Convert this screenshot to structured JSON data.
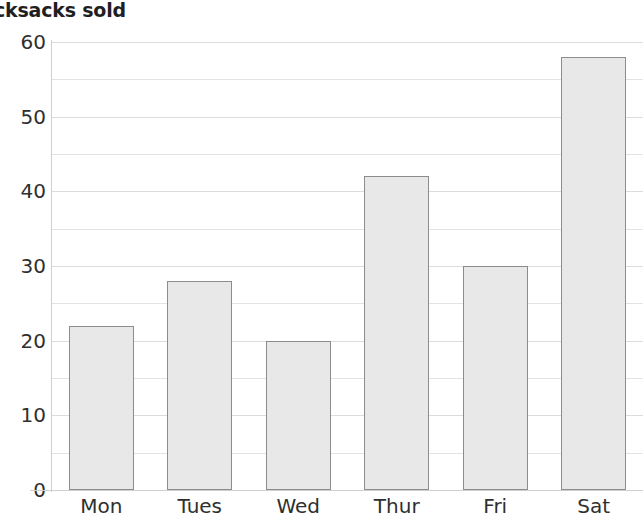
{
  "chart_data": {
    "type": "bar",
    "title": "cksacks sold",
    "xlabel": "",
    "ylabel": "",
    "categories": [
      "Mon",
      "Tues",
      "Wed",
      "Thur",
      "Fri",
      "Sat"
    ],
    "values": [
      22,
      28,
      20,
      42,
      30,
      58
    ],
    "ylim": [
      0,
      60
    ],
    "y_ticks": [
      0,
      10,
      20,
      30,
      40,
      50,
      60
    ],
    "y_tick_labels": [
      "0",
      "10",
      "20",
      "30",
      "40",
      "50",
      "60"
    ],
    "minor_gridline_step": 5,
    "grid": true,
    "legend": false,
    "colors": {
      "bar_fill": "#e8e8e8",
      "bar_border": "#8c8c8c",
      "gridline": "#e3e3e3",
      "axis_line": "#cfcfcf",
      "text": "#2f2f2f",
      "title_text": "#1f1f1f",
      "background": "#ffffff"
    }
  }
}
